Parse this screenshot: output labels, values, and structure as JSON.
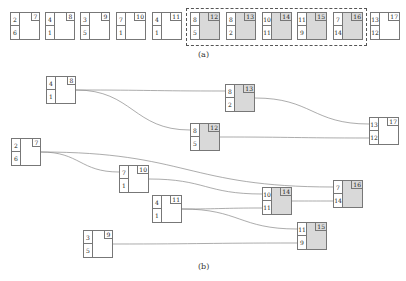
{
  "panel_a": {
    "caption": "(a)",
    "nodes": [
      {
        "id": "7",
        "top": "2",
        "bottom": "6",
        "shaded": false,
        "x": 10,
        "y": 12
      },
      {
        "id": "8",
        "top": "4",
        "bottom": "1",
        "shaded": false,
        "x": 45,
        "y": 12
      },
      {
        "id": "9",
        "top": "3",
        "bottom": "5",
        "shaded": false,
        "x": 80,
        "y": 12
      },
      {
        "id": "10",
        "top": "7",
        "bottom": "1",
        "shaded": false,
        "x": 116,
        "y": 12
      },
      {
        "id": "11",
        "top": "4",
        "bottom": "1",
        "shaded": false,
        "x": 152,
        "y": 12
      },
      {
        "id": "12",
        "top": "8",
        "bottom": "5",
        "shaded": true,
        "x": 190,
        "y": 12
      },
      {
        "id": "13",
        "top": "8",
        "bottom": "2",
        "shaded": true,
        "x": 226,
        "y": 12
      },
      {
        "id": "14",
        "top": "10",
        "bottom": "11",
        "shaded": true,
        "x": 262,
        "y": 12
      },
      {
        "id": "15",
        "top": "11",
        "bottom": "9",
        "shaded": true,
        "x": 297,
        "y": 12
      },
      {
        "id": "16",
        "top": "7",
        "bottom": "14",
        "shaded": true,
        "x": 333,
        "y": 12
      },
      {
        "id": "17",
        "top": "13",
        "bottom": "12",
        "shaded": false,
        "x": 370,
        "y": 12
      }
    ],
    "dashed_group": [
      "12",
      "13",
      "14",
      "15",
      "16"
    ]
  },
  "panel_b": {
    "caption": "(b)",
    "nodes": [
      {
        "id": "8",
        "top": "4",
        "bottom": "1",
        "shaded": false,
        "x": 46,
        "y": 76
      },
      {
        "id": "13",
        "top": "8",
        "bottom": "2",
        "shaded": true,
        "x": 225,
        "y": 84
      },
      {
        "id": "12",
        "top": "8",
        "bottom": "5",
        "shaded": true,
        "x": 190,
        "y": 123
      },
      {
        "id": "17",
        "top": "13",
        "bottom": "12",
        "shaded": false,
        "x": 369,
        "y": 117
      },
      {
        "id": "7",
        "top": "2",
        "bottom": "6",
        "shaded": false,
        "x": 11,
        "y": 138
      },
      {
        "id": "10",
        "top": "7",
        "bottom": "1",
        "shaded": false,
        "x": 119,
        "y": 165
      },
      {
        "id": "16",
        "top": "7",
        "bottom": "14",
        "shaded": true,
        "x": 333,
        "y": 180
      },
      {
        "id": "14",
        "top": "10",
        "bottom": "11",
        "shaded": true,
        "x": 262,
        "y": 187
      },
      {
        "id": "11",
        "top": "4",
        "bottom": "1",
        "shaded": false,
        "x": 152,
        "y": 195
      },
      {
        "id": "15",
        "top": "11",
        "bottom": "9",
        "shaded": true,
        "x": 297,
        "y": 222
      },
      {
        "id": "9",
        "top": "3",
        "bottom": "5",
        "shaded": false,
        "x": 83,
        "y": 230
      }
    ],
    "edges": [
      {
        "from": "8",
        "to": "13",
        "port": "top"
      },
      {
        "from": "8",
        "to": "12",
        "port": "top"
      },
      {
        "from": "13",
        "to": "17",
        "port": "top"
      },
      {
        "from": "12",
        "to": "17",
        "port": "bottom"
      },
      {
        "from": "7",
        "to": "10",
        "port": "top"
      },
      {
        "from": "7",
        "to": "16",
        "port": "top"
      },
      {
        "from": "10",
        "to": "14",
        "port": "top"
      },
      {
        "from": "11",
        "to": "14",
        "port": "bottom"
      },
      {
        "from": "11",
        "to": "15",
        "port": "top"
      },
      {
        "from": "14",
        "to": "16",
        "port": "bottom"
      },
      {
        "from": "9",
        "to": "15",
        "port": "bottom"
      }
    ]
  }
}
